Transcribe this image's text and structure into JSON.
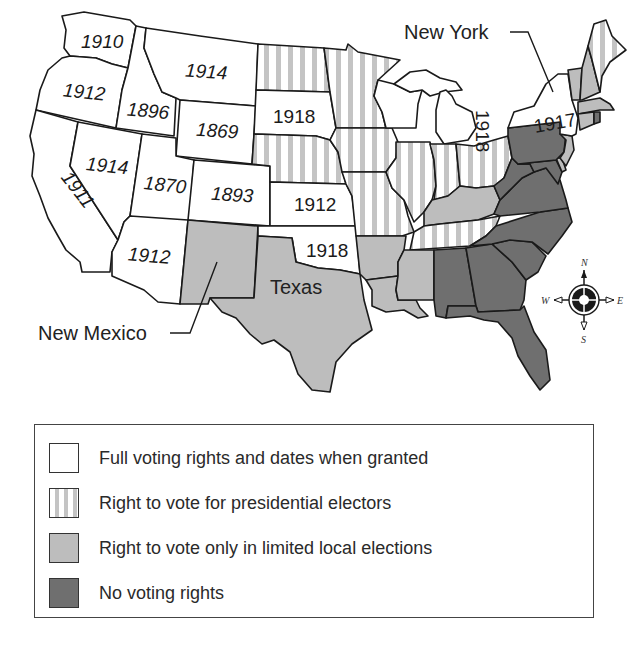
{
  "map": {
    "title_callouts": {
      "new_york": "New York",
      "new_mexico": "New Mexico",
      "texas": "Texas"
    },
    "compass": {
      "n": "N",
      "s": "S",
      "e": "E",
      "w": "W"
    },
    "colors": {
      "full": "#ffffff",
      "presidential_stripe": "#c4c4c4",
      "local": "#bdbdbd",
      "none": "#6f6f6f",
      "border": "#1a1a1a"
    },
    "states": {
      "washington": {
        "category": "full",
        "year": "1910"
      },
      "oregon": {
        "category": "full",
        "year": "1912"
      },
      "california": {
        "category": "full",
        "year": "1911"
      },
      "idaho": {
        "category": "full",
        "year": "1896"
      },
      "nevada": {
        "category": "full",
        "year": "1914"
      },
      "montana": {
        "category": "full",
        "year": "1914"
      },
      "wyoming": {
        "category": "full",
        "year": "1869"
      },
      "utah": {
        "category": "full",
        "year": "1870"
      },
      "colorado": {
        "category": "full",
        "year": "1893"
      },
      "arizona": {
        "category": "full",
        "year": "1912"
      },
      "new_mexico": {
        "category": "local",
        "year": ""
      },
      "north_dakota": {
        "category": "presidential",
        "year": ""
      },
      "south_dakota": {
        "category": "full",
        "year": "1918"
      },
      "nebraska": {
        "category": "presidential",
        "year": ""
      },
      "kansas": {
        "category": "full",
        "year": "1912"
      },
      "oklahoma": {
        "category": "full",
        "year": "1918"
      },
      "texas": {
        "category": "local",
        "year": ""
      },
      "minnesota": {
        "category": "presidential",
        "year": ""
      },
      "iowa": {
        "category": "presidential",
        "year": ""
      },
      "missouri": {
        "category": "presidential",
        "year": ""
      },
      "arkansas": {
        "category": "local",
        "year": ""
      },
      "louisiana": {
        "category": "local",
        "year": ""
      },
      "wisconsin": {
        "category": "full",
        "year": ""
      },
      "michigan": {
        "category": "full",
        "year": "1918"
      },
      "illinois": {
        "category": "presidential",
        "year": ""
      },
      "indiana": {
        "category": "presidential",
        "year": ""
      },
      "ohio": {
        "category": "presidential",
        "year": ""
      },
      "kentucky": {
        "category": "local",
        "year": ""
      },
      "tennessee": {
        "category": "presidential",
        "year": ""
      },
      "mississippi": {
        "category": "local",
        "year": ""
      },
      "alabama": {
        "category": "none",
        "year": ""
      },
      "georgia": {
        "category": "none",
        "year": ""
      },
      "florida": {
        "category": "none",
        "year": ""
      },
      "south_carolina": {
        "category": "none",
        "year": ""
      },
      "north_carolina": {
        "category": "none",
        "year": ""
      },
      "virginia": {
        "category": "none",
        "year": ""
      },
      "west_virginia": {
        "category": "none",
        "year": ""
      },
      "maryland": {
        "category": "none",
        "year": ""
      },
      "delaware": {
        "category": "local",
        "year": ""
      },
      "pennsylvania": {
        "category": "none",
        "year": ""
      },
      "new_jersey": {
        "category": "local",
        "year": ""
      },
      "new_york": {
        "category": "full",
        "year": "1917"
      },
      "vermont": {
        "category": "local",
        "year": ""
      },
      "new_hampshire": {
        "category": "local",
        "year": ""
      },
      "maine": {
        "category": "presidential",
        "year": ""
      },
      "massachusetts": {
        "category": "local",
        "year": ""
      },
      "connecticut": {
        "category": "local",
        "year": ""
      },
      "rhode_island": {
        "category": "presidential",
        "year": ""
      }
    }
  },
  "legend": {
    "items": [
      {
        "key": "full",
        "label": "Full voting rights and dates when granted"
      },
      {
        "key": "presidential",
        "label": "Right to vote for presidential electors"
      },
      {
        "key": "local",
        "label": "Right to vote only in limited local elections"
      },
      {
        "key": "none",
        "label": "No voting rights"
      }
    ]
  }
}
